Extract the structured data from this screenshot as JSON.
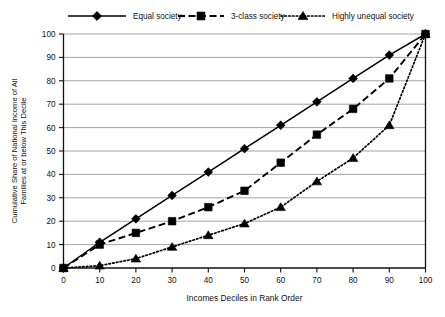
{
  "chart_data": {
    "type": "line",
    "title": "",
    "xlabel": "Incomes Deciles in Rank Order",
    "ylabel": "Cumulative Share of National Income of All Families at or below This Decile",
    "xlim": [
      0,
      100
    ],
    "ylim": [
      0,
      100
    ],
    "xticks": [
      0,
      10,
      20,
      30,
      40,
      50,
      60,
      70,
      80,
      90,
      100
    ],
    "yticks": [
      0,
      10,
      20,
      30,
      40,
      50,
      60,
      70,
      80,
      90,
      100
    ],
    "grid": "horizontal",
    "legend_position": "top",
    "x": [
      0,
      10,
      20,
      30,
      40,
      50,
      60,
      70,
      80,
      90,
      100
    ],
    "series": [
      {
        "name": "Equal society",
        "marker": "diamond",
        "linestyle": "solid",
        "color": "#000000",
        "values": [
          0,
          11,
          21,
          31,
          41,
          51,
          61,
          71,
          81,
          91,
          100
        ]
      },
      {
        "name": "3-class society",
        "marker": "square",
        "linestyle": "dashed",
        "color": "#000000",
        "values": [
          0,
          10,
          15,
          20,
          26,
          33,
          45,
          57,
          68,
          81,
          100
        ]
      },
      {
        "name": "Highly unequal society",
        "marker": "triangle",
        "linestyle": "dotted",
        "color": "#000000",
        "values": [
          0,
          1,
          4,
          9,
          14,
          19,
          26,
          37,
          47,
          61,
          100
        ]
      }
    ]
  },
  "legend": {
    "items": [
      {
        "label": "Equal society"
      },
      {
        "label": "3-class society"
      },
      {
        "label": "Highly unequal society"
      }
    ]
  },
  "axes": {
    "x_title": "Incomes Deciles in Rank Order",
    "y_title_line1": "Cumulative Share of National Income of All",
    "y_title_line2": "Families at or below This Decile",
    "x_tick_labels": [
      "0",
      "10",
      "20",
      "30",
      "40",
      "50",
      "60",
      "70",
      "80",
      "90",
      "100"
    ],
    "y_tick_labels": [
      "0",
      "10",
      "20",
      "30",
      "40",
      "50",
      "60",
      "70",
      "80",
      "90",
      "100"
    ]
  }
}
